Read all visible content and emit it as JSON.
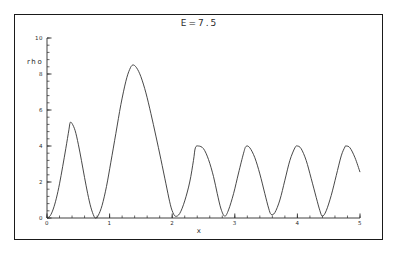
{
  "chart_data": {
    "type": "line",
    "title": "E=7.5",
    "xlabel": "x",
    "ylabel": "rho",
    "xlim": [
      0,
      5
    ],
    "ylim": [
      0,
      10
    ],
    "grid": false,
    "legend": "none",
    "x_major_ticks": [
      0,
      1,
      2,
      3,
      4,
      5
    ],
    "x_major_tick_labels": [
      "0",
      "1",
      "2",
      "3",
      "4",
      "5"
    ],
    "x_minor_tick_step": 0.2,
    "y_major_ticks": [
      0,
      2,
      4,
      6,
      8,
      10
    ],
    "y_major_tick_labels": [
      "0",
      "2",
      "4",
      "6",
      "8",
      "10"
    ],
    "y_minor_tick_step": 0.4,
    "series": [
      {
        "name": "rho",
        "color": "#333333",
        "peaks": [
          {
            "x": 0.37,
            "y": 5.3
          },
          {
            "x": 1.37,
            "y": 8.5
          },
          {
            "x": 2.37,
            "y": 4.0
          },
          {
            "x": 3.18,
            "y": 4.0
          },
          {
            "x": 4.0,
            "y": 4.0
          },
          {
            "x": 4.78,
            "y": 4.0
          }
        ],
        "minima": [
          {
            "x": 0.0,
            "y": 0.0
          },
          {
            "x": 0.78,
            "y": 0.0
          },
          {
            "x": 2.0,
            "y": 0.0
          },
          {
            "x": 2.78,
            "y": 0.0
          },
          {
            "x": 3.58,
            "y": 0.0
          },
          {
            "x": 4.4,
            "y": 0.0
          }
        ],
        "x": [
          0.0,
          0.05,
          0.1,
          0.15,
          0.2,
          0.25,
          0.3,
          0.35,
          0.37,
          0.4,
          0.45,
          0.5,
          0.55,
          0.6,
          0.65,
          0.7,
          0.75,
          0.78,
          0.82,
          0.88,
          0.95,
          1.02,
          1.1,
          1.18,
          1.26,
          1.32,
          1.37,
          1.43,
          1.5,
          1.58,
          1.66,
          1.74,
          1.82,
          1.9,
          1.96,
          2.0,
          2.05,
          2.12,
          2.2,
          2.28,
          2.34,
          2.37,
          2.42,
          2.5,
          2.58,
          2.66,
          2.72,
          2.78,
          2.84,
          2.9,
          2.98,
          3.06,
          3.14,
          3.18,
          3.24,
          3.32,
          3.4,
          3.48,
          3.54,
          3.58,
          3.64,
          3.72,
          3.8,
          3.88,
          3.96,
          4.0,
          4.06,
          4.14,
          4.22,
          4.3,
          4.36,
          4.4,
          4.46,
          4.54,
          4.62,
          4.7,
          4.76,
          4.78,
          4.84,
          4.92,
          5.0
        ],
        "y": [
          0.0,
          0.12,
          0.5,
          1.1,
          1.9,
          2.85,
          3.85,
          4.9,
          5.3,
          5.25,
          4.85,
          4.1,
          3.2,
          2.25,
          1.35,
          0.6,
          0.1,
          0.0,
          0.15,
          0.7,
          1.75,
          3.1,
          4.7,
          6.3,
          7.6,
          8.25,
          8.5,
          8.35,
          7.85,
          6.95,
          5.8,
          4.55,
          3.25,
          1.9,
          0.9,
          0.4,
          0.1,
          0.25,
          0.95,
          2.0,
          3.2,
          3.9,
          4.0,
          3.85,
          3.25,
          2.3,
          1.35,
          0.5,
          0.1,
          0.45,
          1.35,
          2.5,
          3.6,
          3.98,
          3.9,
          3.35,
          2.45,
          1.35,
          0.55,
          0.2,
          0.3,
          1.0,
          2.1,
          3.2,
          3.9,
          4.0,
          3.85,
          3.2,
          2.2,
          1.15,
          0.4,
          0.1,
          0.4,
          1.25,
          2.35,
          3.45,
          3.95,
          4.0,
          3.9,
          3.35,
          2.55
        ]
      }
    ]
  }
}
